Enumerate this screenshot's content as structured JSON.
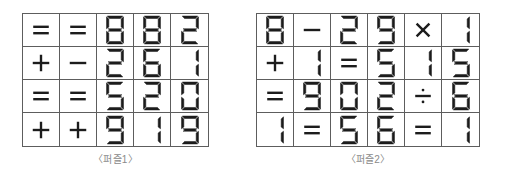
{
  "puzzles": [
    {
      "id": "puzzle1",
      "caption": "〈퍼즐1〉",
      "columns": 5,
      "rows": 4,
      "cells": [
        [
          "=",
          "=",
          "8",
          "8",
          "2"
        ],
        [
          "+",
          "−",
          "2",
          "6",
          "1"
        ],
        [
          "=",
          "=",
          "5",
          "2",
          "0"
        ],
        [
          "+",
          "+",
          "9",
          "1",
          "9"
        ]
      ]
    },
    {
      "id": "puzzle2",
      "caption": "〈퍼즐2〉",
      "columns": 6,
      "rows": 4,
      "cells": [
        [
          "8",
          "−",
          "2",
          "9",
          "×",
          "1"
        ],
        [
          "+",
          "1",
          "=",
          "5",
          "1",
          "5"
        ],
        [
          "=",
          "9",
          "0",
          "2",
          "÷",
          "6"
        ],
        [
          "1",
          "=",
          "5",
          "6",
          "=",
          "1"
        ]
      ]
    }
  ],
  "style": {
    "digit_color": "#1c1c1c",
    "operator_color": "#1c1c1c",
    "grid_line_color": "#5d5d5d",
    "caption_color": "#8a8a8a",
    "background_color": "#ffffff"
  }
}
